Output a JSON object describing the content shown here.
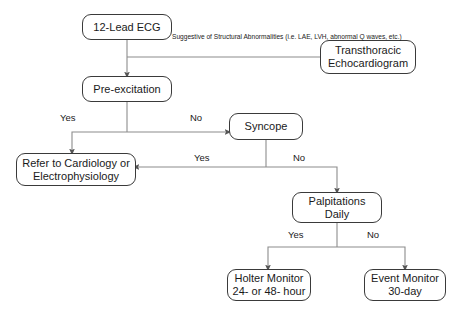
{
  "diagram": {
    "background_color": "#ffffff",
    "edge_color": "#8c8c8c",
    "arrow_color": "#555555",
    "node_border_color": "#3a3a3a",
    "text_color": "#1a1a1a"
  },
  "nodes": {
    "ecg": {
      "line1": "12-Lead ECG",
      "line2": ""
    },
    "tte": {
      "line1": "Transthoracic",
      "line2": "Echocardiogram"
    },
    "preexcitation": {
      "line1": "Pre-excitation",
      "line2": ""
    },
    "syncope": {
      "line1": "Syncope",
      "line2": ""
    },
    "refer": {
      "line1": "Refer to Cardiology or",
      "line2": "Electrophysiology"
    },
    "palpitations": {
      "line1": "Palpitations",
      "line2": "Daily"
    },
    "holter": {
      "line1": "Holter Monitor",
      "line2": "24- or 48- hour"
    },
    "event": {
      "line1": "Event Monitor",
      "line2": "30-day"
    }
  },
  "annotations": {
    "structural": {
      "line1": "Suggestive of Structural Abnormalities",
      "line2": "(i.e. LAE, LVH, abnormal Q waves, etc.)"
    }
  },
  "edge_labels": {
    "preexcitation_yes": "Yes",
    "preexcitation_no": "No",
    "syncope_yes": "Yes",
    "syncope_no": "No",
    "palpitations_yes": "Yes",
    "palpitations_no": "No"
  }
}
